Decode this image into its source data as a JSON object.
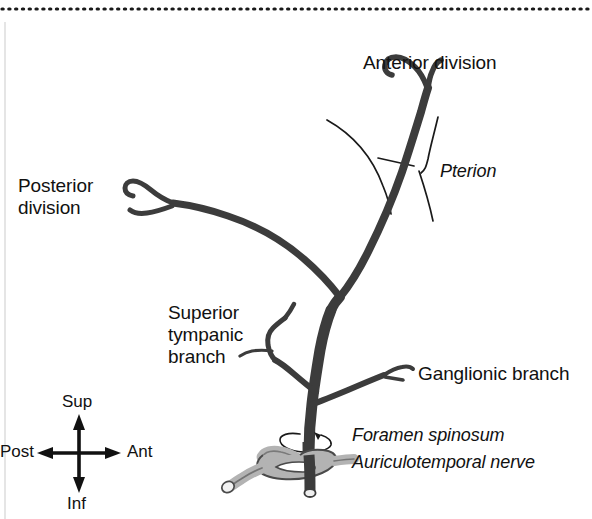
{
  "figure": {
    "background_color": "#ffffff",
    "artery_color": "#3c3c3c",
    "artery_highlight_color": "#6b6b6b",
    "nerve_fill_color": "#b3b3b3",
    "suture_color": "#1a1a1a",
    "text_color": "#111111",
    "border_color": "#1a1a1a",
    "width": 592,
    "height": 519
  },
  "labels": {
    "anterior_division": "Anterior division",
    "posterior_division_line1": "Posterior",
    "posterior_division_line2": "division",
    "pterion": "Pterion",
    "superior_tympanic_line1": "Superior",
    "superior_tympanic_line2": "tympanic",
    "superior_tympanic_line3": "branch",
    "ganglionic_branch": "Ganglionic branch",
    "foramen_spinosum": "Foramen spinosum",
    "auriculotemporal_nerve": "Auriculotemporal nerve"
  },
  "compass": {
    "superior": "Sup",
    "inferior": "Inf",
    "anterior": "Ant",
    "posterior": "Post"
  }
}
